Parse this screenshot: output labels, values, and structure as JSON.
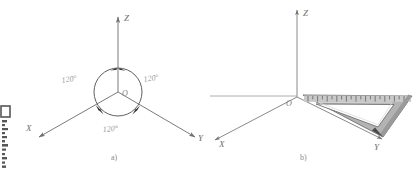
{
  "figure": {
    "background_color": "#ffffff",
    "line_color": "#7b7b7b",
    "label_color": "#6e6e6e",
    "angle_label_color": "#9a9a9a",
    "ruler_fill_color": "#b3b3b3",
    "ruler_edge_color": "#7a7a7a",
    "ruler_highlight_color": "#d8d8d8"
  },
  "panel_a": {
    "caption": "a)",
    "origin_label": "O",
    "axes": [
      {
        "name": "z-axis",
        "label": "Z"
      },
      {
        "name": "x-axis",
        "label": "X"
      },
      {
        "name": "y-axis",
        "label": "Y"
      }
    ],
    "angles": [
      {
        "name": "angle-left",
        "label": "120°"
      },
      {
        "name": "angle-right",
        "label": "120°"
      },
      {
        "name": "angle-bottom",
        "label": "120°"
      }
    ],
    "circle": {
      "cx": 118,
      "cy": 92,
      "r": 24
    }
  },
  "panel_b": {
    "caption": "b)",
    "origin_label": "O",
    "axes": [
      {
        "name": "z-axis",
        "label": "Z"
      },
      {
        "name": "x-axis",
        "label": "X"
      },
      {
        "name": "y-axis",
        "label": "Y"
      }
    ],
    "ruler": {
      "name": "triangle-ruler",
      "tick_count": 22
    }
  },
  "margin_artifact": {
    "name": "scan-margin-mark"
  }
}
